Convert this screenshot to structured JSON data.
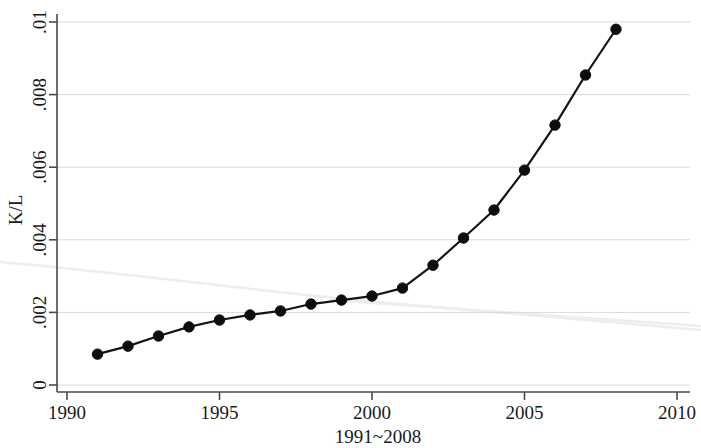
{
  "chart_data": {
    "type": "line",
    "title": "",
    "xlabel": "1991~2008",
    "ylabel": "K/L",
    "x": [
      1991,
      1992,
      1993,
      1994,
      1995,
      1996,
      1997,
      1998,
      1999,
      2000,
      2001,
      2002,
      2003,
      2004,
      2005,
      2006,
      2007,
      2008
    ],
    "values": [
      0.00085,
      0.00107,
      0.00135,
      0.0016,
      0.00179,
      0.00193,
      0.00204,
      0.00223,
      0.00234,
      0.00245,
      0.00267,
      0.0033,
      0.00405,
      0.00482,
      0.00592,
      0.00716,
      0.00854,
      0.0098
    ],
    "series": [
      {
        "name": "K/L",
        "values": [
          0.00085,
          0.00107,
          0.00135,
          0.0016,
          0.00179,
          0.00193,
          0.00204,
          0.00223,
          0.00234,
          0.00245,
          0.00267,
          0.0033,
          0.00405,
          0.00482,
          0.00592,
          0.00716,
          0.00854,
          0.0098
        ]
      }
    ],
    "xlim": [
      1990,
      2010
    ],
    "ylim": [
      0,
      0.01
    ],
    "xticks": [
      1990,
      1995,
      2000,
      2005,
      2010
    ],
    "xtick_labels": [
      "1990",
      "1995",
      "2000",
      "2005",
      "2010"
    ],
    "yticks": [
      0,
      0.002,
      0.004,
      0.006,
      0.008,
      0.01
    ],
    "ytick_labels": [
      "0",
      ".002",
      ".004",
      ".006",
      ".008",
      ".01"
    ],
    "grid": "horizontal",
    "legend": "none",
    "marker": "filled-circle",
    "line_color": "#141414",
    "marker_color": "#0d0d0d",
    "grid_color": "#d9d9d9",
    "axis_color": "#4a4a4a",
    "background_color": "#ffffff"
  },
  "axis": {
    "y_title": "K/L",
    "x_title": "1991~2008",
    "ytick_0": "0",
    "ytick_1": ".002",
    "ytick_2": ".004",
    "ytick_3": ".006",
    "ytick_4": ".008",
    "ytick_5": ".01",
    "xtick_0": "1990",
    "xtick_1": "1995",
    "xtick_2": "2000",
    "xtick_3": "2005",
    "xtick_4": "2010"
  }
}
